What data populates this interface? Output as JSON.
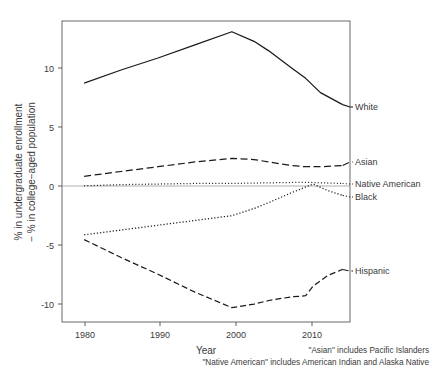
{
  "chart_data": {
    "type": "line",
    "title": "",
    "xlabel": "Year",
    "ylabel": "% in undergraduate enrollment\n− % in college−aged population",
    "ylabel_line1": "% in undergraduate enrollment",
    "ylabel_line2": "− % in college−aged population",
    "xlim": [
      1977,
      2016
    ],
    "ylim": [
      -11.6,
      13.6
    ],
    "xticks": [
      1980,
      1990,
      2000,
      2010
    ],
    "xtick_labels": [
      "1980",
      "1990",
      "2000",
      "2010"
    ],
    "yticks": [
      10,
      5,
      0,
      -5,
      -10
    ],
    "ytick_labels": [
      "10",
      "5",
      "0",
      "-5",
      "-10"
    ],
    "grid": false,
    "zero_reference_line": true,
    "legend_position": "right-inline-labels",
    "series": [
      {
        "name": "White",
        "label": "White",
        "line_style": "solid",
        "color": "#1a1a1a",
        "x": [
          1980,
          1985,
          1990,
          1995,
          2000,
          2003,
          2005,
          2008,
          2010,
          2012,
          2015
        ],
        "values": [
          8.4,
          9.5,
          10.5,
          11.6,
          12.7,
          11.9,
          11.1,
          9.7,
          8.8,
          7.6,
          6.6
        ]
      },
      {
        "name": "Asian",
        "label": "Asian",
        "line_style": "dashed",
        "color": "#1a1a1a",
        "x": [
          1980,
          1985,
          1990,
          1995,
          2000,
          2003,
          2005,
          2008,
          2010,
          2012,
          2015
        ],
        "values": [
          0.6,
          1.0,
          1.4,
          1.8,
          2.1,
          2.0,
          1.8,
          1.5,
          1.4,
          1.4,
          1.5
        ]
      },
      {
        "name": "Native American",
        "label": "Native American",
        "line_style": "dotted",
        "color": "#1a1a1a",
        "x": [
          1980,
          1985,
          1990,
          1995,
          2000,
          2005,
          2010,
          2012,
          2015
        ],
        "values": [
          -0.2,
          -0.1,
          -0.05,
          0.0,
          0.0,
          0.05,
          0.1,
          0.05,
          0.0
        ]
      },
      {
        "name": "Black",
        "label": "Black",
        "line_style": "dashdot",
        "color": "#1a1a1a",
        "x": [
          1980,
          1985,
          1990,
          1995,
          2000,
          2003,
          2005,
          2008,
          2010,
          2011,
          2013,
          2015
        ],
        "values": [
          -4.3,
          -3.9,
          -3.5,
          -3.1,
          -2.7,
          -2.1,
          -1.6,
          -0.8,
          -0.3,
          -0.05,
          -0.6,
          -1.0
        ]
      },
      {
        "name": "Hispanic",
        "label": "Hispanic",
        "line_style": "longdash",
        "color": "#1a1a1a",
        "x": [
          1980,
          1985,
          1990,
          1995,
          2000,
          2003,
          2005,
          2008,
          2010,
          2011,
          2013,
          2015
        ],
        "values": [
          -4.7,
          -6.2,
          -7.6,
          -9.1,
          -10.4,
          -10.1,
          -9.8,
          -9.5,
          -9.4,
          -8.6,
          -7.7,
          -7.2
        ]
      }
    ],
    "annotations": [
      "\"Asian\" includes Pacific Islanders",
      "\"Native American\" includes American Indian and Alaska Native"
    ]
  },
  "footnotes": {
    "line1": "\"Asian\" includes Pacific Islanders",
    "line2": "\"Native American\" includes American Indian and Alaska Native"
  }
}
